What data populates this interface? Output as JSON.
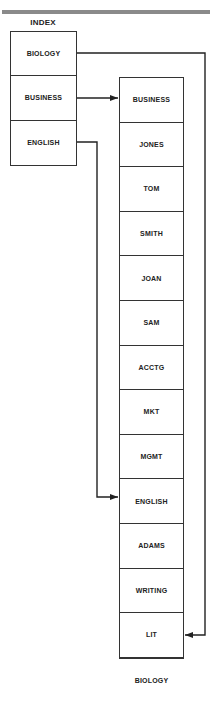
{
  "diagram": {
    "index": {
      "title": "INDEX",
      "entries": [
        {
          "label": "BIOLOGY"
        },
        {
          "label": "BUSINESS"
        },
        {
          "label": "ENGLISH"
        }
      ]
    },
    "chain": {
      "nodes": [
        {
          "label": "BUSINESS"
        },
        {
          "label": "JONES"
        },
        {
          "label": "TOM"
        },
        {
          "label": "SMITH"
        },
        {
          "label": "JOAN"
        },
        {
          "label": "SAM"
        },
        {
          "label": "ACCTG"
        },
        {
          "label": "MKT"
        },
        {
          "label": "MGMT"
        },
        {
          "label": "ENGLISH"
        },
        {
          "label": "ADAMS"
        },
        {
          "label": "WRITING"
        },
        {
          "label": "LIT"
        },
        {
          "label": "BIOLOGY"
        }
      ]
    },
    "links": [
      {
        "from": "BIOLOGY",
        "to": "BIOLOGY"
      },
      {
        "from": "BUSINESS",
        "to": "BUSINESS"
      },
      {
        "from": "ENGLISH",
        "to": "ENGLISH"
      }
    ],
    "colors": {
      "line": "#222222",
      "topbar": "#8a8a8a",
      "border": "#333333"
    }
  }
}
